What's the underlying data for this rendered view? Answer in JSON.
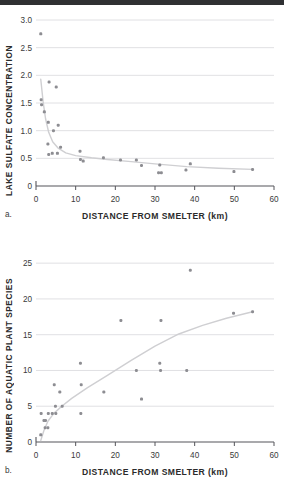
{
  "topbar": {
    "color": "#2f3032"
  },
  "style": {
    "marker_color": "#8d8d92",
    "line_color": "#cfcfd2",
    "grid_color": "#d8d8dc",
    "axis_color": "#55555a"
  },
  "figures": [
    {
      "tag": "a.",
      "chart_data": {
        "type": "scatter",
        "title": "",
        "xlabel": "DISTANCE FROM SMELTER (km)",
        "ylabel": "LAKE SULFATE CONCENTRATION",
        "xlim": [
          0,
          60
        ],
        "ylim": [
          0,
          3.0
        ],
        "xticks": [
          0,
          10,
          20,
          30,
          40,
          50,
          60
        ],
        "xtick_labels": [
          "0",
          "10",
          "20",
          "30",
          "40",
          "50",
          "60"
        ],
        "yticks": [
          0,
          0.5,
          1.0,
          1.5,
          2.0,
          2.5,
          3.0
        ],
        "ytick_labels": [
          "0",
          "0.5",
          "1.0",
          "1.5",
          "2.0",
          "2.5",
          "3.0"
        ],
        "grid": "horizontal",
        "legend": "none",
        "points": [
          [
            1.2,
            2.75
          ],
          [
            1.3,
            1.56
          ],
          [
            1.4,
            1.47
          ],
          [
            2.1,
            1.34
          ],
          [
            3.3,
            1.88
          ],
          [
            3.1,
            1.15
          ],
          [
            5.1,
            1.79
          ],
          [
            4.4,
            1.0
          ],
          [
            5.6,
            1.1
          ],
          [
            3.0,
            0.76
          ],
          [
            3.2,
            0.57
          ],
          [
            4.1,
            0.59
          ],
          [
            5.4,
            0.59
          ],
          [
            6.2,
            0.7
          ],
          [
            11.1,
            0.63
          ],
          [
            11.2,
            0.48
          ],
          [
            11.9,
            0.45
          ],
          [
            17.0,
            0.51
          ],
          [
            21.3,
            0.47
          ],
          [
            25.3,
            0.47
          ],
          [
            26.6,
            0.37
          ],
          [
            30.9,
            0.24
          ],
          [
            31.6,
            0.24
          ],
          [
            31.2,
            0.38
          ],
          [
            37.8,
            0.29
          ],
          [
            38.9,
            0.4
          ],
          [
            49.9,
            0.26
          ],
          [
            54.6,
            0.3
          ]
        ],
        "trend": [
          [
            1.2,
            1.93
          ],
          [
            1.8,
            1.52
          ],
          [
            2.4,
            1.22
          ],
          [
            3.2,
            0.97
          ],
          [
            4.2,
            0.8
          ],
          [
            5.5,
            0.69
          ],
          [
            7.5,
            0.6
          ],
          [
            10.0,
            0.55
          ],
          [
            14.0,
            0.51
          ],
          [
            18.0,
            0.48
          ],
          [
            24.0,
            0.44
          ],
          [
            30.0,
            0.4
          ],
          [
            38.0,
            0.35
          ],
          [
            46.0,
            0.32
          ],
          [
            54.6,
            0.3
          ]
        ]
      }
    },
    {
      "tag": "b.",
      "chart_data": {
        "type": "scatter",
        "title": "",
        "xlabel": "DISTANCE FROM SMELTER (km)",
        "ylabel": "NUMBER OF AQUATIC PLANT SPECIES",
        "xlim": [
          0,
          60
        ],
        "ylim": [
          0,
          26
        ],
        "xticks": [
          0,
          10,
          20,
          30,
          40,
          50,
          60
        ],
        "xtick_labels": [
          "0",
          "10",
          "20",
          "30",
          "40",
          "50",
          "60"
        ],
        "yticks": [
          0,
          5,
          10,
          15,
          20,
          25
        ],
        "ytick_labels": [
          "0",
          "5",
          "10",
          "15",
          "20",
          "25"
        ],
        "grid": "horizontal",
        "legend": "none",
        "points": [
          [
            1.2,
            1.0
          ],
          [
            1.3,
            4.0
          ],
          [
            2.0,
            3.0
          ],
          [
            2.4,
            3.0
          ],
          [
            2.3,
            2.0
          ],
          [
            3.0,
            2.0
          ],
          [
            3.1,
            4.0
          ],
          [
            4.1,
            4.0
          ],
          [
            4.6,
            8.0
          ],
          [
            4.9,
            5.0
          ],
          [
            5.0,
            4.0
          ],
          [
            6.0,
            7.0
          ],
          [
            6.6,
            5.0
          ],
          [
            11.2,
            11.0
          ],
          [
            11.4,
            8.0
          ],
          [
            11.3,
            4.0
          ],
          [
            17.1,
            7.0
          ],
          [
            21.4,
            17.0
          ],
          [
            25.3,
            10.0
          ],
          [
            26.6,
            6.0
          ],
          [
            31.2,
            11.0
          ],
          [
            31.4,
            10.0
          ],
          [
            31.5,
            17.0
          ],
          [
            38.0,
            10.0
          ],
          [
            38.9,
            24.0
          ],
          [
            49.8,
            18.0
          ],
          [
            54.6,
            18.2
          ]
        ],
        "trend": [
          [
            1.2,
            0.2
          ],
          [
            2.0,
            1.6
          ],
          [
            3.0,
            2.9
          ],
          [
            4.5,
            4.0
          ],
          [
            6.5,
            5.0
          ],
          [
            9.0,
            6.1
          ],
          [
            13.0,
            7.6
          ],
          [
            18.0,
            9.3
          ],
          [
            24.0,
            11.4
          ],
          [
            30.0,
            13.4
          ],
          [
            36.0,
            15.1
          ],
          [
            42.0,
            16.3
          ],
          [
            48.0,
            17.3
          ],
          [
            54.6,
            18.2
          ]
        ]
      }
    }
  ]
}
